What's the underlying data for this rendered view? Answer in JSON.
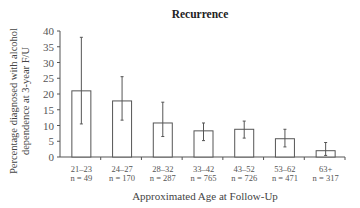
{
  "chart_data": {
    "type": "bar",
    "title": "Recurrence",
    "xlabel": "Approximated Age at Follow-Up",
    "ylabel": "Percentage diagnosed with alcohol dependence at 3-year F/U",
    "ylabel_lines": [
      "Percentage diagnosed with alcohol",
      "dependence at 3-year F/U"
    ],
    "ylim": [
      0,
      40
    ],
    "yticks": [
      0,
      5,
      10,
      15,
      20,
      25,
      30,
      35,
      40
    ],
    "grid": false,
    "legend": null,
    "categories": [
      "21–23",
      "24–27",
      "28–32",
      "33–42",
      "43–52",
      "53–62",
      "63+"
    ],
    "n_labels": [
      "n = 49",
      "n = 170",
      "n = 287",
      "n = 765",
      "n = 726",
      "n = 471",
      "n = 317"
    ],
    "values": [
      21.0,
      17.8,
      10.8,
      8.3,
      8.8,
      5.8,
      2.0
    ],
    "error_upper": [
      38.0,
      25.5,
      17.4,
      10.8,
      11.4,
      8.8,
      4.6
    ],
    "error_lower": [
      10.5,
      11.7,
      6.5,
      5.2,
      6.0,
      3.2,
      0.5
    ]
  }
}
